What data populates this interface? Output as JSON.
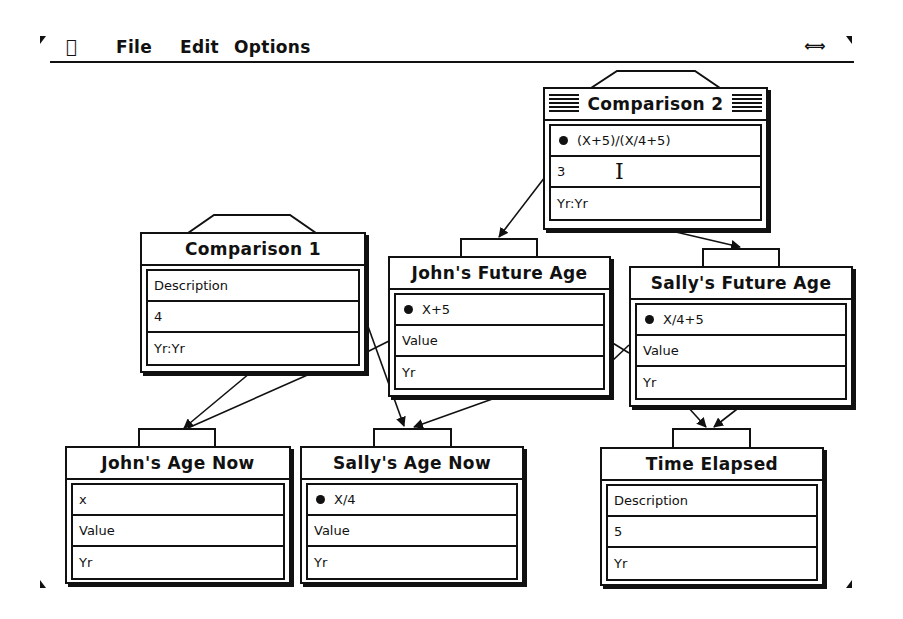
{
  "menubar": {
    "apple_icon": "",
    "items": [
      {
        "label": "File"
      },
      {
        "label": "Edit"
      },
      {
        "label": "Options"
      }
    ],
    "switcher_icon": "⟺"
  },
  "nodes": {
    "comparison2": {
      "title": "Comparison 2",
      "rows": [
        "(X+5)/(X/4+5)",
        "3",
        "Yr:Yr"
      ],
      "bullet_row": 0,
      "active": true
    },
    "comparison1": {
      "title": "Comparison 1",
      "rows": [
        "Description",
        "4",
        "Yr:Yr"
      ]
    },
    "johns_future_age": {
      "title": "John's Future Age",
      "rows": [
        "X+5",
        "Value",
        "Yr"
      ],
      "bullet_row": 0
    },
    "sallys_future_age": {
      "title": "Sally's Future Age",
      "rows": [
        "X/4+5",
        "Value",
        "Yr"
      ],
      "bullet_row": 0
    },
    "johns_age_now": {
      "title": "John's Age Now",
      "rows": [
        "x",
        "Value",
        "Yr"
      ]
    },
    "sallys_age_now": {
      "title": "Sally's Age Now",
      "rows": [
        "X/4",
        "Value",
        "Yr"
      ],
      "bullet_row": 0
    },
    "time_elapsed": {
      "title": "Time Elapsed",
      "rows": [
        "Description",
        "5",
        "Yr"
      ]
    }
  },
  "cursor": {
    "type": "i-beam",
    "glyph": "I"
  },
  "colors": {
    "ink": "#111111",
    "paper": "#ffffff"
  }
}
